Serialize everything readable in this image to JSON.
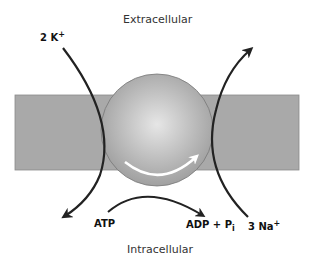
{
  "regions": {
    "extracellular": "Extracellular",
    "intracellular": "Intracellular"
  },
  "ions": {
    "potassium_count": "2 K",
    "potassium_charge": "+",
    "sodium_count": "3 Na",
    "sodium_charge": "+"
  },
  "energy": {
    "atp": "ATP",
    "adp": "ADP + P",
    "pi_subscript": "i"
  },
  "colors": {
    "membrane": "#a9a9a9",
    "pump_sphere": "#bdbdbd",
    "arrow": "#222222",
    "rotation_arrow": "#ffffff"
  }
}
